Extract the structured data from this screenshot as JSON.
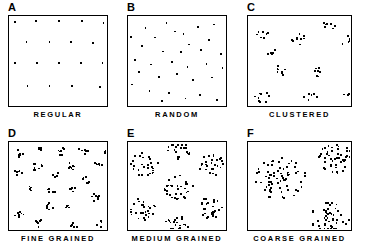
{
  "figure": {
    "width": 365,
    "height": 251,
    "background": "#ffffff",
    "dot_color": "#000000",
    "border_color": "#000000"
  },
  "chart_data": {
    "type": "scatter",
    "xlabel": "",
    "ylabel": "",
    "xlim": [
      0,
      100
    ],
    "ylim": [
      0,
      100
    ],
    "grid": false,
    "legend": "none",
    "layout": {
      "rows": 2,
      "cols": 3
    },
    "panels": [
      {
        "letter": "A",
        "caption": "REGULAR",
        "pattern": "regular lattice",
        "n_points": 18,
        "points": [
          [
            4,
            96
          ],
          [
            26,
            97
          ],
          [
            50,
            97
          ],
          [
            74,
            97
          ],
          [
            97,
            95
          ],
          [
            16,
            73
          ],
          [
            40,
            73
          ],
          [
            63,
            73
          ],
          [
            86,
            72
          ],
          [
            4,
            49
          ],
          [
            27,
            49
          ],
          [
            50,
            49
          ],
          [
            73,
            49
          ],
          [
            96,
            49
          ],
          [
            17,
            22
          ],
          [
            40,
            22
          ],
          [
            64,
            22
          ],
          [
            93,
            21
          ]
        ]
      },
      {
        "letter": "B",
        "caption": "RANDOM",
        "pattern": "random (Poisson)",
        "n_points": 33,
        "points": [
          [
            16,
            89
          ],
          [
            38,
            95
          ],
          [
            56,
            82
          ],
          [
            71,
            90
          ],
          [
            88,
            93
          ],
          [
            1,
            79
          ],
          [
            26,
            78
          ],
          [
            47,
            85
          ],
          [
            62,
            70
          ],
          [
            83,
            75
          ],
          [
            12,
            68
          ],
          [
            34,
            62
          ],
          [
            53,
            61
          ],
          [
            74,
            64
          ],
          [
            95,
            59
          ],
          [
            5,
            52
          ],
          [
            22,
            47
          ],
          [
            44,
            50
          ],
          [
            60,
            44
          ],
          [
            80,
            48
          ],
          [
            97,
            43
          ],
          [
            9,
            38
          ],
          [
            30,
            33
          ],
          [
            49,
            36
          ],
          [
            66,
            29
          ],
          [
            86,
            32
          ],
          [
            2,
            24
          ],
          [
            20,
            17
          ],
          [
            41,
            14
          ],
          [
            58,
            8
          ],
          [
            73,
            12
          ],
          [
            91,
            6
          ],
          [
            33,
            5
          ]
        ]
      },
      {
        "letter": "C",
        "caption": "CLUSTERED",
        "pattern": "clustered",
        "n_points": 52,
        "clusters": [
          {
            "cx": 13,
            "cy": 84,
            "n": 7,
            "spread": 7
          },
          {
            "cx": 79,
            "cy": 93,
            "n": 7,
            "spread": 6
          },
          {
            "cx": 48,
            "cy": 76,
            "n": 10,
            "spread": 8
          },
          {
            "cx": 97,
            "cy": 74,
            "n": 6,
            "spread": 6
          },
          {
            "cx": 20,
            "cy": 62,
            "n": 5,
            "spread": 5
          },
          {
            "cx": 30,
            "cy": 40,
            "n": 8,
            "spread": 7
          },
          {
            "cx": 67,
            "cy": 38,
            "n": 7,
            "spread": 6
          },
          {
            "cx": 12,
            "cy": 10,
            "n": 9,
            "spread": 8
          },
          {
            "cx": 60,
            "cy": 8,
            "n": 7,
            "spread": 7
          },
          {
            "cx": 97,
            "cy": 12,
            "n": 3,
            "spread": 4
          }
        ]
      },
      {
        "letter": "D",
        "caption": "FINE GRAINED",
        "pattern": "fine grained clustering",
        "n_points": 115,
        "clusters": [
          {
            "cx": 9,
            "cy": 90,
            "n": 6,
            "spread": 5
          },
          {
            "cx": 29,
            "cy": 94,
            "n": 5,
            "spread": 4
          },
          {
            "cx": 53,
            "cy": 92,
            "n": 7,
            "spread": 5
          },
          {
            "cx": 76,
            "cy": 93,
            "n": 6,
            "spread": 5
          },
          {
            "cx": 96,
            "cy": 92,
            "n": 4,
            "spread": 4
          },
          {
            "cx": 28,
            "cy": 73,
            "n": 8,
            "spread": 6
          },
          {
            "cx": 62,
            "cy": 74,
            "n": 7,
            "spread": 5
          },
          {
            "cx": 91,
            "cy": 75,
            "n": 6,
            "spread": 5
          },
          {
            "cx": 6,
            "cy": 66,
            "n": 6,
            "spread": 5
          },
          {
            "cx": 46,
            "cy": 64,
            "n": 6,
            "spread": 5
          },
          {
            "cx": 78,
            "cy": 58,
            "n": 7,
            "spread": 5
          },
          {
            "cx": 21,
            "cy": 48,
            "n": 5,
            "spread": 4
          },
          {
            "cx": 43,
            "cy": 46,
            "n": 7,
            "spread": 5
          },
          {
            "cx": 64,
            "cy": 47,
            "n": 6,
            "spread": 5
          },
          {
            "cx": 88,
            "cy": 38,
            "n": 7,
            "spread": 5
          },
          {
            "cx": 40,
            "cy": 28,
            "n": 6,
            "spread": 5
          },
          {
            "cx": 60,
            "cy": 26,
            "n": 4,
            "spread": 3
          },
          {
            "cx": 8,
            "cy": 18,
            "n": 7,
            "spread": 5
          },
          {
            "cx": 29,
            "cy": 7,
            "n": 6,
            "spread": 5
          },
          {
            "cx": 66,
            "cy": 6,
            "n": 5,
            "spread": 4
          },
          {
            "cx": 94,
            "cy": 6,
            "n": 4,
            "spread": 4
          }
        ]
      },
      {
        "letter": "E",
        "caption": "MEDIUM GRAINED",
        "pattern": "medium grained clustering",
        "n_points": 170,
        "clusters": [
          {
            "cx": 51,
            "cy": 95,
            "n": 22,
            "spread": 13
          },
          {
            "cx": 14,
            "cy": 76,
            "n": 28,
            "spread": 15
          },
          {
            "cx": 85,
            "cy": 76,
            "n": 26,
            "spread": 14
          },
          {
            "cx": 50,
            "cy": 50,
            "n": 30,
            "spread": 16
          },
          {
            "cx": 13,
            "cy": 24,
            "n": 28,
            "spread": 15
          },
          {
            "cx": 85,
            "cy": 26,
            "n": 26,
            "spread": 14
          },
          {
            "cx": 49,
            "cy": 5,
            "n": 20,
            "spread": 13
          }
        ]
      },
      {
        "letter": "F",
        "caption": "COARSE GRAINED",
        "pattern": "coarse grained clustering",
        "n_points": 165,
        "clusters": [
          {
            "cx": 30,
            "cy": 60,
            "n": 70,
            "spread": 26
          },
          {
            "cx": 85,
            "cy": 83,
            "n": 48,
            "spread": 18
          },
          {
            "cx": 80,
            "cy": 14,
            "n": 47,
            "spread": 20
          }
        ]
      }
    ]
  },
  "panel_geometry": [
    {
      "left": 8,
      "top": 2,
      "box_w": 100,
      "box_h": 92,
      "caption_top": 110,
      "caption_w": 100
    },
    {
      "left": 127,
      "top": 2,
      "box_w": 100,
      "box_h": 92,
      "caption_top": 110,
      "caption_w": 100
    },
    {
      "left": 247,
      "top": 2,
      "box_w": 105,
      "box_h": 92,
      "caption_top": 110,
      "caption_w": 105
    },
    {
      "left": 8,
      "top": 128,
      "box_w": 100,
      "box_h": 90,
      "caption_top": 234,
      "caption_w": 100
    },
    {
      "left": 127,
      "top": 128,
      "box_w": 100,
      "box_h": 90,
      "caption_top": 234,
      "caption_w": 100
    },
    {
      "left": 247,
      "top": 128,
      "box_w": 105,
      "box_h": 90,
      "caption_top": 234,
      "caption_w": 105
    }
  ]
}
